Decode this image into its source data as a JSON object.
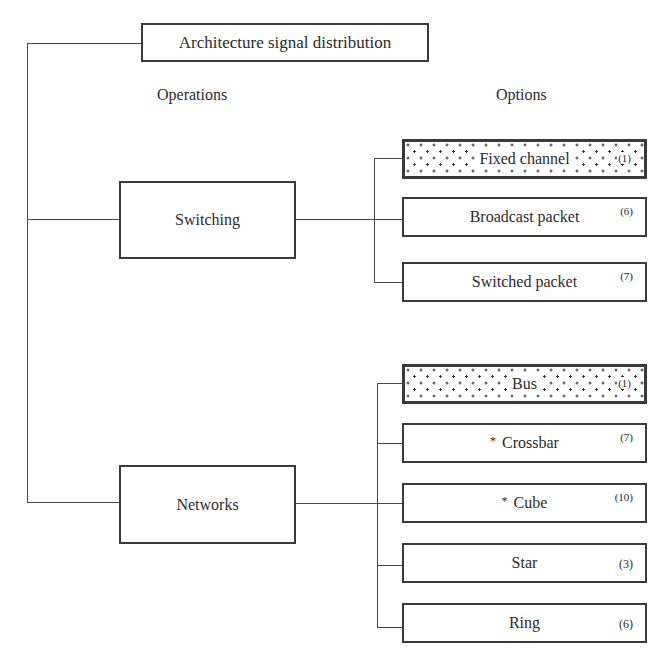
{
  "diagram": {
    "title": "Architecture signal distribution",
    "columns": {
      "left_heading": "Operations",
      "right_heading": "Options"
    },
    "operations": [
      {
        "label": "Switching",
        "options": [
          {
            "label": "Fixed channel",
            "count": "(1)",
            "highlighted": true,
            "marked": false
          },
          {
            "label": "Broadcast packet",
            "count": "(6)",
            "highlighted": false,
            "marked": false
          },
          {
            "label": "Switched packet",
            "count": "(7)",
            "highlighted": false,
            "marked": false
          }
        ]
      },
      {
        "label": "Networks",
        "options": [
          {
            "label": "Bus",
            "count": "(1)",
            "highlighted": true,
            "marked": false
          },
          {
            "label": "Crossbar",
            "count": "(7)",
            "highlighted": false,
            "marked": true
          },
          {
            "label": "Cube",
            "count": "(10)",
            "highlighted": false,
            "marked": true
          },
          {
            "label": "Star",
            "count": "(3)",
            "highlighted": false,
            "marked": false
          },
          {
            "label": "Ring",
            "count": "(6)",
            "highlighted": false,
            "marked": false
          }
        ]
      }
    ],
    "marker_symbol": "*",
    "colors": {
      "line": "#4a4a4a",
      "border": "#3a3a3a",
      "text": "#2b2b2b",
      "background": "#ffffff"
    }
  }
}
